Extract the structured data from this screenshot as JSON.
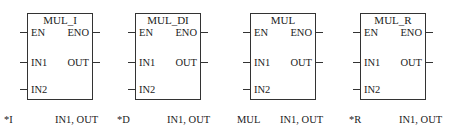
{
  "blocks": [
    {
      "title": "MUL_I",
      "inputs": [
        "EN",
        "IN1",
        "IN2"
      ],
      "outputs": [
        "ENO",
        "OUT"
      ],
      "caption_mnemonic": "*I",
      "caption_operands": "IN1, OUT"
    },
    {
      "title": "MUL_DI",
      "inputs": [
        "EN",
        "IN1",
        "IN2"
      ],
      "outputs": [
        "ENO",
        "OUT"
      ],
      "caption_mnemonic": "*D",
      "caption_operands": "IN1, OUT"
    },
    {
      "title": "MUL",
      "inputs": [
        "EN",
        "IN1",
        "IN2"
      ],
      "outputs": [
        "ENO",
        "OUT"
      ],
      "caption_mnemonic": "MUL",
      "caption_operands": "IN1, OUT"
    },
    {
      "title": "MUL_R",
      "inputs": [
        "EN",
        "IN1",
        "IN2"
      ],
      "outputs": [
        "ENO",
        "OUT"
      ],
      "caption_mnemonic": "*R",
      "caption_operands": "IN1, OUT"
    }
  ]
}
